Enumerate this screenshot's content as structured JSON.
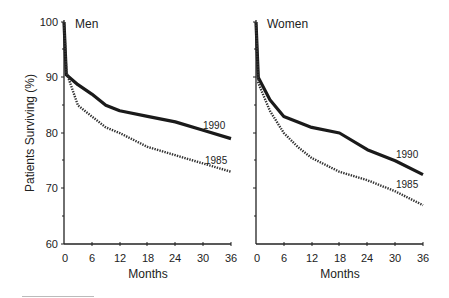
{
  "chart_data": [
    {
      "type": "line",
      "title": "Men",
      "xlabel": "Months",
      "ylabel": "Patients Surviving (%)",
      "xlim": [
        0,
        36
      ],
      "ylim": [
        60,
        100
      ],
      "xticks": [
        0,
        6,
        12,
        18,
        24,
        30,
        36
      ],
      "yticks": [
        60,
        70,
        80,
        90,
        100
      ],
      "grid": false,
      "x": [
        0,
        0.5,
        3,
        6,
        9,
        12,
        18,
        24,
        30,
        36
      ],
      "series": [
        {
          "name": "1990",
          "style": "solid",
          "values": [
            100,
            90.5,
            88.7,
            87,
            85,
            84,
            83,
            82,
            80.5,
            79
          ]
        },
        {
          "name": "1985",
          "style": "dotted",
          "values": [
            100,
            91,
            85,
            83,
            81,
            80,
            77.5,
            76,
            74.5,
            73
          ]
        }
      ]
    },
    {
      "type": "line",
      "title": "Women",
      "xlabel": "Months",
      "ylabel": "",
      "xlim": [
        0,
        36
      ],
      "ylim": [
        60,
        100
      ],
      "xticks": [
        0,
        6,
        12,
        18,
        24,
        30,
        36
      ],
      "yticks": [
        60,
        70,
        80,
        90,
        100
      ],
      "grid": false,
      "x": [
        0,
        0.5,
        3,
        6,
        9,
        12,
        18,
        24,
        30,
        36
      ],
      "series": [
        {
          "name": "1990",
          "style": "solid",
          "values": [
            100,
            90,
            86,
            83,
            82,
            81,
            80,
            77,
            75,
            72.5
          ]
        },
        {
          "name": "1985",
          "style": "dotted",
          "values": [
            100,
            89,
            84,
            80,
            77.5,
            75.5,
            73,
            71.5,
            69.5,
            67
          ]
        }
      ]
    }
  ],
  "labels": {
    "ylabel": "Patients Surviving (%)",
    "men_title": "Men",
    "women_title": "Women",
    "xlabel": "Months",
    "yticks": [
      "100",
      "90",
      "80",
      "70",
      "60"
    ],
    "xticks": [
      "0",
      "6",
      "12",
      "18",
      "24",
      "30",
      "36"
    ],
    "series_1990": "1990",
    "series_1985": "1985"
  }
}
